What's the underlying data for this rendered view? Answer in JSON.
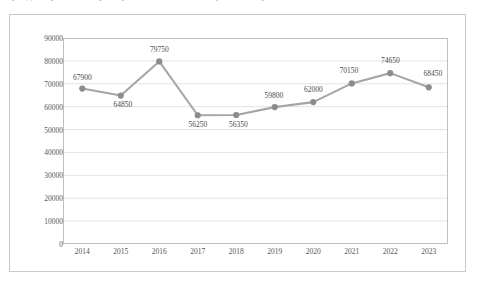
{
  "top_fragment": "граждан, принятых на работу, а также численность уволенных работников",
  "chart_data": {
    "type": "line",
    "title": "",
    "subtitle": "",
    "xlabel": "",
    "ylabel": "",
    "categories": [
      "2014",
      "2015",
      "2016",
      "2017",
      "2018",
      "2019",
      "2020",
      "2021",
      "2022",
      "2023"
    ],
    "values": [
      67900,
      64850,
      79750,
      56250,
      56350,
      59800,
      62000,
      70150,
      74650,
      68450
    ],
    "point_labels": [
      "67900",
      "64850",
      "79750",
      "56250",
      "56350",
      "59800",
      "62000",
      "70150",
      "74650",
      "68450"
    ],
    "series": [
      {
        "name": "",
        "values": [
          67900,
          64850,
          79750,
          56250,
          56350,
          59800,
          62000,
          70150,
          74650,
          68450
        ]
      }
    ],
    "ylim": [
      0,
      90000
    ],
    "ytick_values": [
      0,
      10000,
      20000,
      30000,
      40000,
      50000,
      60000,
      70000,
      80000,
      90000
    ],
    "ytick_labels": [
      "0",
      "10000",
      "20000",
      "30000",
      "40000",
      "50000",
      "60000",
      "70000",
      "80000",
      "90000"
    ],
    "grid": "horizontal",
    "legend": "none",
    "colors": {
      "line": "#a6a6a6",
      "marker": "#8c8c8c",
      "grid": "#d9d9d9",
      "axis": "#bfbfbf",
      "text": "#555555",
      "border": "#c9c9c9",
      "background": "#ffffff"
    },
    "label_offsets": [
      {
        "dx": 0,
        "dy": -7,
        "align": "above"
      },
      {
        "dx": 2,
        "dy": 13,
        "align": "below"
      },
      {
        "dx": 0,
        "dy": -7,
        "align": "above"
      },
      {
        "dx": 0,
        "dy": 14,
        "align": "below"
      },
      {
        "dx": 2,
        "dy": 14,
        "align": "below"
      },
      {
        "dx": -1,
        "dy": -7,
        "align": "above"
      },
      {
        "dx": 0,
        "dy": -8,
        "align": "above"
      },
      {
        "dx": -3,
        "dy": -8,
        "align": "above"
      },
      {
        "dx": 0,
        "dy": -8,
        "align": "above"
      },
      {
        "dx": 4,
        "dy": -9,
        "align": "above"
      }
    ]
  }
}
